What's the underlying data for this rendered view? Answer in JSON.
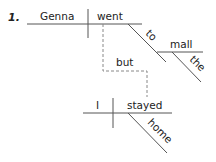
{
  "diagram": {
    "item_number": "1.",
    "clause1": {
      "subject": "Genna",
      "verb": "went",
      "modifier_preposition": "to",
      "object_of_preposition": "mall",
      "article": "the"
    },
    "conjunction": "but",
    "clause2": {
      "subject": "I",
      "verb": "stayed",
      "modifier_adverb": "home"
    }
  }
}
